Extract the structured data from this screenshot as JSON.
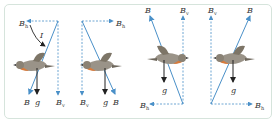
{
  "diagram": {
    "colors": {
      "field_vector": "#4a90c8",
      "gravity": "#222222",
      "frame_border": "#d6e4dc",
      "bird_body": "#8a8275",
      "bird_breast": "#d97a3a"
    },
    "labels": {
      "B": "B",
      "B_h_sub": "h",
      "B_v_sub": "v",
      "g": "g",
      "I": "I"
    },
    "panels": [
      {
        "id": 1,
        "B_direction": "down-left",
        "B_h_direction": "left",
        "B_v_direction": "down",
        "bird_facing": "left",
        "shows_angle_I": true
      },
      {
        "id": 2,
        "B_direction": "down-right",
        "B_h_direction": "right",
        "B_v_direction": "down",
        "bird_facing": "left",
        "shows_angle_I": false
      },
      {
        "id": 3,
        "B_direction": "up-left",
        "B_h_direction": "left",
        "B_v_direction": "up",
        "bird_facing": "right",
        "shows_angle_I": false
      },
      {
        "id": 4,
        "B_direction": "up-right",
        "B_h_direction": "right",
        "B_v_direction": "up",
        "bird_facing": "left",
        "shows_angle_I": false
      }
    ]
  }
}
